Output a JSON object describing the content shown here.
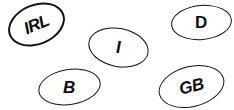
{
  "canvas": {
    "width": 234,
    "height": 110,
    "background_color": "#ffffff",
    "stroke_color": "#121212",
    "text_color": "#0d0d0d"
  },
  "ovals": [
    {
      "id": "irl",
      "label": "IRL",
      "name": "oval-sticker-irl",
      "rotation_deg": -22,
      "position": {
        "x": 7,
        "y": 4
      },
      "size": {
        "width": 59,
        "height": 41
      }
    },
    {
      "id": "i",
      "label": "I",
      "name": "oval-sticker-i",
      "rotation_deg": 11,
      "position": {
        "x": 88,
        "y": 28
      },
      "size": {
        "width": 61,
        "height": 39
      }
    },
    {
      "id": "d",
      "label": "D",
      "name": "oval-sticker-d",
      "rotation_deg": -5,
      "position": {
        "x": 171,
        "y": 5
      },
      "size": {
        "width": 61,
        "height": 35
      }
    },
    {
      "id": "b",
      "label": "B",
      "name": "oval-sticker-b",
      "rotation_deg": -9,
      "position": {
        "x": 38,
        "y": 69
      },
      "size": {
        "width": 63,
        "height": 36
      }
    },
    {
      "id": "gb",
      "label": "GB",
      "name": "oval-sticker-gb",
      "rotation_deg": -14,
      "position": {
        "x": 158,
        "y": 66
      },
      "size": {
        "width": 67,
        "height": 41
      }
    }
  ]
}
